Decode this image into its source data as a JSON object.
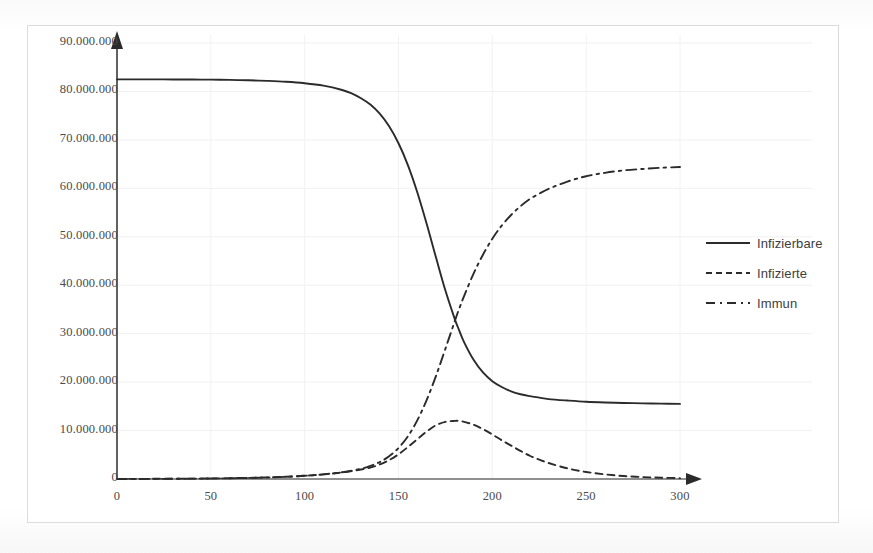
{
  "chart_data": {
    "type": "line",
    "title": "",
    "xlabel": "",
    "ylabel": "",
    "xlim": [
      0,
      300
    ],
    "ylim": [
      0,
      90000000
    ],
    "grid": true,
    "legend_position": "right",
    "x_ticks": [
      "0",
      "50",
      "100",
      "150",
      "200",
      "250",
      "300"
    ],
    "x_tick_values": [
      0,
      50,
      100,
      150,
      200,
      250,
      300
    ],
    "y_ticks": [
      "0",
      "10.000.000",
      "20.000.000",
      "30.000.000",
      "40.000.000",
      "50.000.000",
      "60.000.000",
      "70.000.000",
      "80.000.000",
      "90.000.000"
    ],
    "y_tick_values": [
      0,
      10000000,
      20000000,
      30000000,
      40000000,
      50000000,
      60000000,
      70000000,
      80000000,
      90000000
    ],
    "x": [
      0,
      10,
      20,
      30,
      40,
      50,
      60,
      70,
      80,
      90,
      100,
      110,
      120,
      125,
      130,
      135,
      140,
      145,
      150,
      155,
      160,
      165,
      170,
      175,
      180,
      182,
      185,
      190,
      195,
      200,
      205,
      210,
      215,
      220,
      225,
      230,
      240,
      250,
      260,
      270,
      280,
      290,
      300
    ],
    "series": [
      {
        "name": "Infizierbare",
        "style": "solid",
        "color": "#2b2b2b",
        "values": [
          82500000,
          82500000,
          82490000,
          82480000,
          82460000,
          82430000,
          82380000,
          82300000,
          82180000,
          82000000,
          81700000,
          81200000,
          80300000,
          79600000,
          78600000,
          77300000,
          75400000,
          72800000,
          69300000,
          64800000,
          59200000,
          52700000,
          45700000,
          38900000,
          33000000,
          31000000,
          28200000,
          24600000,
          22000000,
          20200000,
          19000000,
          18100000,
          17500000,
          17100000,
          16800000,
          16500000,
          16200000,
          15950000,
          15800000,
          15700000,
          15620000,
          15560000,
          15500000
        ]
      },
      {
        "name": "Infizierte",
        "style": "dashed",
        "color": "#2b2b2b",
        "values": [
          20000,
          28000,
          40000,
          57000,
          81000,
          115000,
          164000,
          233000,
          331000,
          471000,
          670000,
          950000,
          1350000,
          1620000,
          1950000,
          2340000,
          3000000,
          3900000,
          5100000,
          6600000,
          8200000,
          9800000,
          11100000,
          11800000,
          12000000,
          12000000,
          11800000,
          11200000,
          10300000,
          9200000,
          8000000,
          6900000,
          5800000,
          4800000,
          4000000,
          3300000,
          2200000,
          1450000,
          950000,
          620000,
          400000,
          260000,
          170000
        ]
      },
      {
        "name": "Immun",
        "style": "dashdot",
        "color": "#2b2b2b",
        "values": [
          0,
          10000,
          25000,
          45000,
          70000,
          105000,
          155000,
          225000,
          320000,
          460000,
          660000,
          950000,
          1400000,
          1720000,
          2100000,
          2700000,
          3500000,
          4700000,
          6400000,
          8800000,
          12100000,
          16300000,
          21300000,
          26900000,
          32600000,
          34800000,
          37800000,
          42400000,
          46300000,
          49600000,
          52300000,
          54500000,
          56300000,
          57800000,
          58900000,
          59900000,
          61400000,
          62500000,
          63200000,
          63700000,
          64000000,
          64250000,
          64400000
        ]
      }
    ]
  },
  "axis": {
    "y_arrow": "up-arrow",
    "x_arrow": "right-arrow"
  },
  "legend": {
    "items": [
      {
        "label": "Infizierbare",
        "style": "solid"
      },
      {
        "label": "Infizierte",
        "style": "dashed"
      },
      {
        "label": "Immun",
        "style": "dashdot"
      }
    ]
  }
}
